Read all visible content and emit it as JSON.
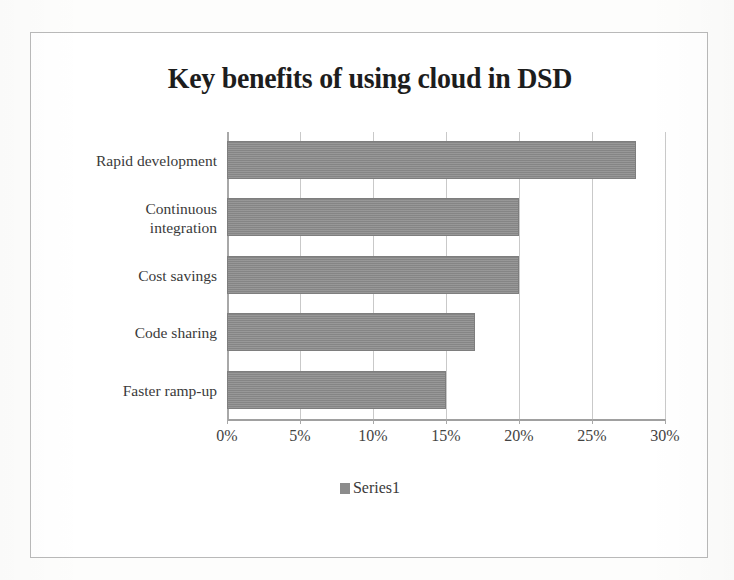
{
  "figure": {
    "title": "Key benefits of using cloud in DSD",
    "frame_color": "#b9b9b9",
    "bar_color": "#8c8c8c",
    "gridline_color": "#c9c9c9"
  },
  "legend": {
    "position": "bottom",
    "swatch_name": "series1-swatch",
    "entries": [
      {
        "label": "Series1",
        "color": "#8c8c8c"
      }
    ]
  },
  "chart_data": {
    "type": "bar",
    "orientation": "horizontal",
    "title": "Key benefits of using cloud in DSD",
    "xlabel": "",
    "ylabel": "",
    "categories": [
      "Rapid development",
      "Continuous integration",
      "Cost savings",
      "Code sharing",
      "Faster ramp-up"
    ],
    "series": [
      {
        "name": "Series1",
        "values": [
          28,
          20,
          20,
          17,
          15
        ],
        "color": "#8c8c8c"
      }
    ],
    "xlim": [
      0,
      30
    ],
    "xticks": [
      0,
      5,
      10,
      15,
      20,
      25,
      30
    ],
    "xticklabels": [
      "0%",
      "5%",
      "10%",
      "15%",
      "20%",
      "25%",
      "30%"
    ],
    "value_format": "percent",
    "grid": "vertical",
    "legend_position": "bottom"
  }
}
